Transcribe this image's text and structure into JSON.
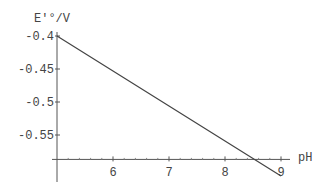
{
  "chart_data": {
    "type": "line",
    "title": "",
    "xlabel": "pH",
    "ylabel": "E'°/V",
    "xlim": [
      5,
      9.3
    ],
    "ylim": [
      -0.62,
      -0.4
    ],
    "axes_origin": {
      "x": 5,
      "y": -0.587
    },
    "x_ticks": [
      6,
      7,
      8,
      9
    ],
    "x_tick_labels": [
      "6",
      "7",
      "8",
      "9"
    ],
    "y_ticks": [
      -0.4,
      -0.45,
      -0.5,
      -0.55
    ],
    "y_tick_labels": [
      "-0.4",
      "-0.45",
      "-0.5",
      "-0.55"
    ],
    "grid": false,
    "series": [
      {
        "name": "E'° vs pH",
        "x": [
          5,
          6,
          7,
          8,
          9
        ],
        "values": [
          -0.4,
          -0.453,
          -0.506,
          -0.559,
          -0.612
        ]
      }
    ],
    "line_color": "#444444"
  }
}
